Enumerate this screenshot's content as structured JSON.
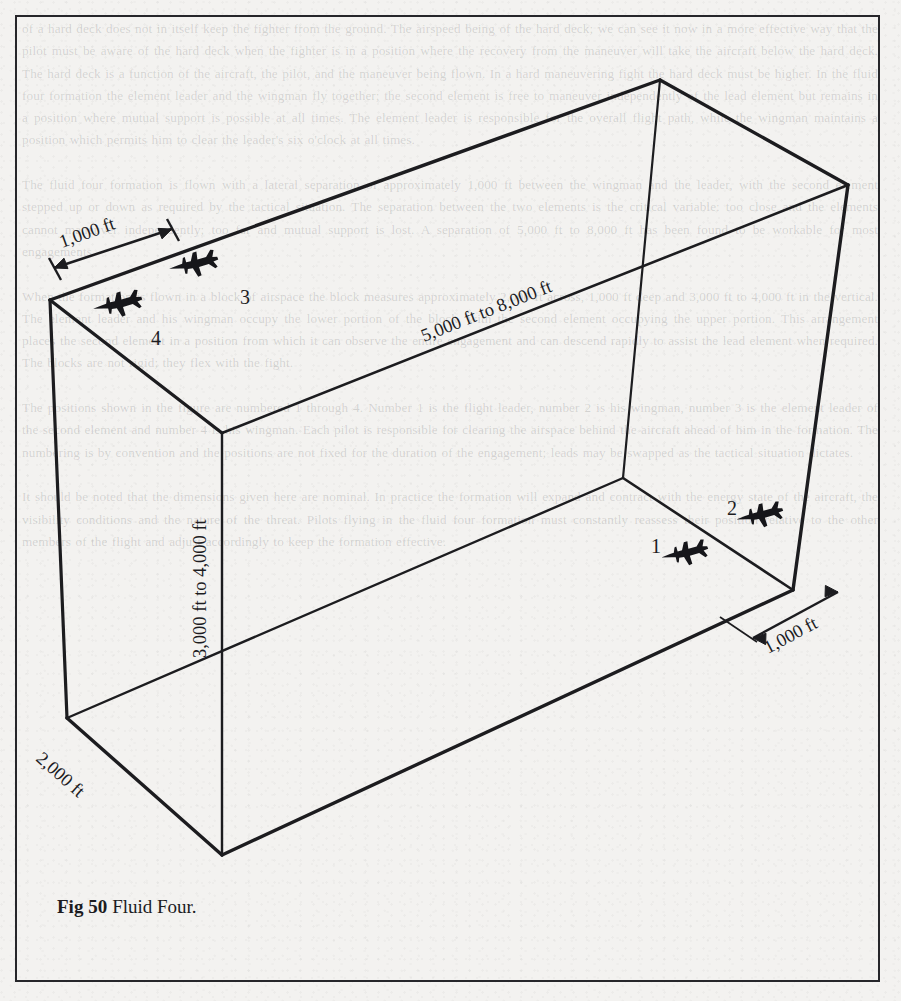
{
  "figure": {
    "caption_label": "Fig 50",
    "caption_text": "Fluid Four.",
    "type": "isometric-box-diagram"
  },
  "dimensions": [
    {
      "id": "depth-top",
      "label": "1,000 ft",
      "location": "top-left-edge"
    },
    {
      "id": "length",
      "label": "5,000 ft to 8,000 ft",
      "location": "top-right-long-edge"
    },
    {
      "id": "height",
      "label": "3,000 ft to 4,000 ft",
      "location": "front-vertical-edge"
    },
    {
      "id": "width-bottom",
      "label": "2,000 ft",
      "location": "bottom-left-edge"
    },
    {
      "id": "depth-bottom",
      "label": "1,000 ft",
      "location": "bottom-right-edge"
    }
  ],
  "aircraft": [
    {
      "id": "aircraft-1",
      "label": "1",
      "x": 687,
      "y": 553,
      "label_x": 651,
      "label_y": 546,
      "position": "floor-front"
    },
    {
      "id": "aircraft-2",
      "label": "2",
      "x": 762,
      "y": 515,
      "label_x": 728,
      "label_y": 508,
      "position": "floor-rear"
    },
    {
      "id": "aircraft-3",
      "label": "3",
      "x": 196,
      "y": 264,
      "label_x": 242,
      "label_y": 300,
      "position": "ceiling-rear"
    },
    {
      "id": "aircraft-4",
      "label": "4",
      "x": 120,
      "y": 304,
      "label_x": 155,
      "label_y": 342,
      "position": "ceiling-front"
    }
  ],
  "colors": {
    "ink": "#1c1c1f",
    "paper": "#f3f2f0",
    "frame": "#26262a"
  },
  "ghost_text": "of a hard deck does not in itself keep the fighter from the ground. The airspeed being of the hard deck; we can see it now in a more effective way that the pilot must be aware of the hard deck when the fighter is in a position where the recovery from the maneuver will take the aircraft below the hard deck. The hard deck is a function of the aircraft, the pilot, and the maneuver being flown. In a hard maneuvering fight the hard deck must be higher. In the fluid four formation the element leader and the wingman fly together; the second element is free to maneuver independently of the lead element but remains in a position where mutual support is possible at all times. The element leader is responsible for the overall flight path, while the wingman maintains a position which permits him to clear the leader's six o'clock at all times.\n\nThe fluid four formation is flown with a lateral separation of approximately 1,000 ft between the wingman and the leader, with the second element stepped up or down as required by the tactical situation. The separation between the two elements is the critical variable: too close and the elements cannot maneuver independently; too far and mutual support is lost. A separation of 5,000 ft to 8,000 ft has been found to be workable for most engagements.\n\nWhen the formation is flown in a block of airspace the block measures approximately 2,000 ft across, 1,000 ft deep and 3,000 ft to 4,000 ft in the vertical. The element leader and his wingman occupy the lower portion of the block, with the second element occupying the upper portion. This arrangement places the second element in a position from which it can observe the entire engagement and can descend rapidly to assist the lead element when required. The blocks are not rigid; they flex with the fight.\n\nThe positions shown in the figure are numbered 1 through 4. Number 1 is the flight leader, number 2 is his wingman, number 3 is the element leader of the second element and number 4 is his wingman. Each pilot is responsible for clearing the airspace behind the aircraft ahead of him in the formation. The numbering is by convention and the positions are not fixed for the duration of the engagement; leads may be swapped as the tactical situation dictates.\n\nIt should be noted that the dimensions given here are nominal. In practice the formation will expand and contract with the energy state of the aircraft, the visibility conditions and the nature of the threat. Pilots flying in the fluid four formation must constantly reassess their position relative to the other members of the flight and adjust accordingly to keep the formation effective."
}
